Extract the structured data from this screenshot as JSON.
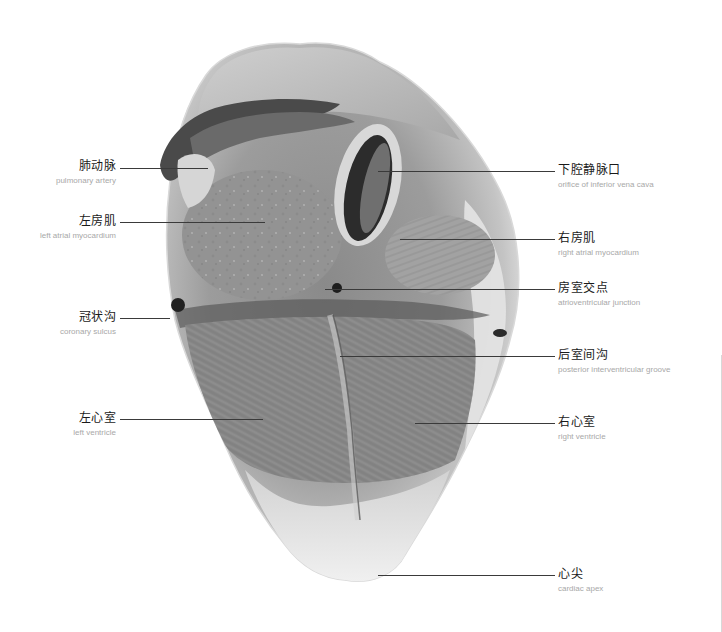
{
  "figure": {
    "colors": {
      "background": "#ffffff",
      "leader_line": "#3a3a3a",
      "label_zh": "#1a1a1a",
      "label_en": "#a8a8a8"
    }
  },
  "labels_left": [
    {
      "zh": "肺动脉",
      "en": "pulmonary artery",
      "line_y": 168,
      "line_x1": 120,
      "line_x2": 208
    },
    {
      "zh": "左房肌",
      "en": "left atrial myocardium",
      "line_y": 222,
      "line_x1": 120,
      "line_x2": 265
    },
    {
      "zh": "冠状沟",
      "en": "coronary sulcus",
      "line_y": 318,
      "line_x1": 120,
      "line_x2": 170
    },
    {
      "zh": "左心室",
      "en": "left ventricle",
      "line_y": 419,
      "line_x1": 120,
      "line_x2": 263
    }
  ],
  "labels_right": [
    {
      "zh": "下腔静脉口",
      "en": "orifice of inferior vena cava",
      "line_y": 171,
      "line_x1": 378,
      "line_x2": 555
    },
    {
      "zh": "右房肌",
      "en": "right atrial myocardium",
      "line_y": 239,
      "line_x1": 400,
      "line_x2": 555
    },
    {
      "zh": "房室交点",
      "en": "atrioventricular junction",
      "line_y": 289,
      "line_x1": 325,
      "line_x2": 555
    },
    {
      "zh": "后室间沟",
      "en": "posterior interventricular groove",
      "line_y": 356,
      "line_x1": 340,
      "line_x2": 555
    },
    {
      "zh": "右心室",
      "en": "right ventricle",
      "line_y": 423,
      "line_x1": 415,
      "line_x2": 555
    },
    {
      "zh": "心尖",
      "en": "cardiac apex",
      "line_y": 575,
      "line_x1": 378,
      "line_x2": 555
    }
  ]
}
